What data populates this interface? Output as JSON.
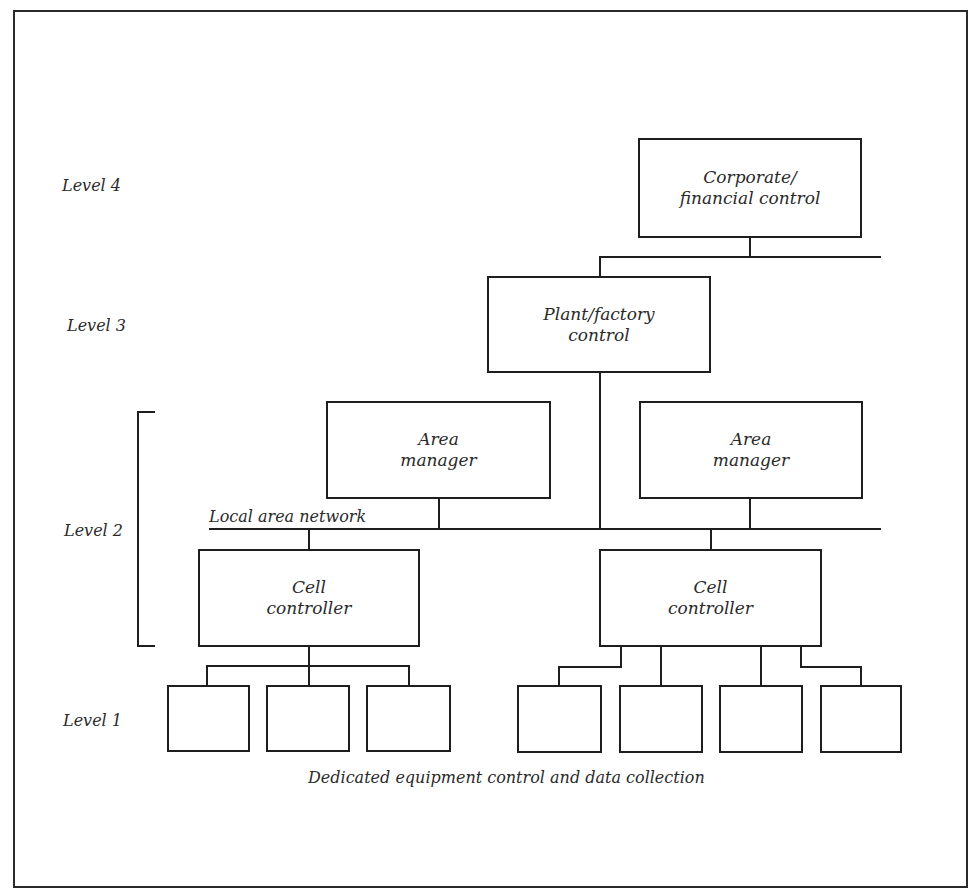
{
  "diagram": {
    "levels": [
      {
        "label": "Level 4"
      },
      {
        "label": "Level 3"
      },
      {
        "label": "Level 2"
      },
      {
        "label": "Level 1"
      }
    ],
    "nodes": {
      "corporate": {
        "line1": "Corporate/",
        "line2": "financial control"
      },
      "plant": {
        "line1": "Plant/factory",
        "line2": "control"
      },
      "area_manager_left": {
        "line1": "Area",
        "line2": "manager"
      },
      "area_manager_right": {
        "line1": "Area",
        "line2": "manager"
      },
      "cell_controller_left": {
        "line1": "Cell",
        "line2": "controller"
      },
      "cell_controller_right": {
        "line1": "Cell",
        "line2": "controller"
      }
    },
    "network_label": "Local area network",
    "equipment_boxes_left": 3,
    "equipment_boxes_right": 4,
    "caption": "Dedicated equipment control and data collection"
  }
}
